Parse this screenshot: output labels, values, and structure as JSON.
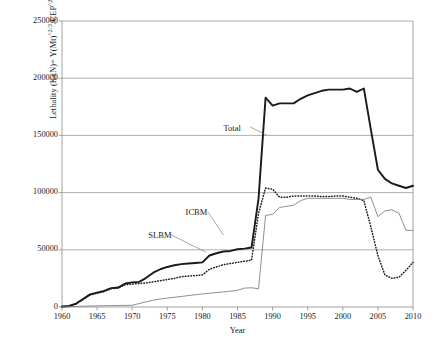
{
  "chart_data": {
    "type": "line",
    "title": "",
    "xlabel": "Year",
    "ylabel": "Lethality (KxN)= Y(Mt)^2/3/CEP^2 x N",
    "xlim": [
      1960,
      2010
    ],
    "ylim": [
      0,
      250000
    ],
    "grid": true,
    "legend_position": "inline-annotations",
    "xticks": [
      "1960",
      "1965",
      "1970",
      "1975",
      "1980",
      "1985",
      "1990",
      "1995",
      "2000",
      "2005",
      "2010"
    ],
    "xtick_values": [
      1960,
      1965,
      1970,
      1975,
      1980,
      1985,
      1990,
      1995,
      2000,
      2005,
      2010
    ],
    "yticks": [
      "0",
      "50000",
      "100000",
      "150000",
      "200000",
      "250000"
    ],
    "ytick_values": [
      0,
      50000,
      100000,
      150000,
      200000,
      250000
    ],
    "series": [
      {
        "name": "Total",
        "style": "solid-thick-black",
        "color": "#1a1a1a",
        "x": [
          1960,
          1961,
          1962,
          1963,
          1964,
          1965,
          1966,
          1967,
          1968,
          1969,
          1970,
          1971,
          1972,
          1973,
          1974,
          1975,
          1976,
          1977,
          1978,
          1979,
          1980,
          1981,
          1982,
          1983,
          1984,
          1985,
          1986,
          1987,
          1988,
          1989,
          1990,
          1991,
          1992,
          1993,
          1994,
          1995,
          1996,
          1997,
          1998,
          1999,
          2000,
          2001,
          2002,
          2003,
          2004,
          2005,
          2006,
          2007,
          2008,
          2009,
          2010
        ],
        "values": [
          500,
          900,
          3000,
          7000,
          11000,
          12500,
          14000,
          16500,
          17000,
          20500,
          21500,
          22000,
          25500,
          30000,
          33000,
          35000,
          36500,
          37500,
          38000,
          38500,
          39000,
          45000,
          47000,
          48500,
          49000,
          50500,
          51000,
          52000,
          95000,
          183000,
          176000,
          178000,
          178000,
          178000,
          182000,
          185000,
          187000,
          189000,
          190000,
          190000,
          190000,
          191000,
          188000,
          191000,
          155000,
          120000,
          112000,
          108000,
          106000,
          104000,
          106000
        ]
      },
      {
        "name": "ICBM",
        "style": "dotted-black",
        "color": "#1a1a1a",
        "x": [
          1960,
          1961,
          1962,
          1963,
          1964,
          1965,
          1966,
          1967,
          1968,
          1969,
          1970,
          1971,
          1972,
          1973,
          1974,
          1975,
          1976,
          1977,
          1978,
          1979,
          1980,
          1981,
          1982,
          1983,
          1984,
          1985,
          1986,
          1987,
          1988,
          1989,
          1990,
          1991,
          1992,
          1993,
          1994,
          1995,
          1996,
          1997,
          1998,
          1999,
          2000,
          2001,
          2002,
          2003,
          2004,
          2005,
          2006,
          2007,
          2008,
          2009,
          2010
        ],
        "values": [
          300,
          600,
          2500,
          6500,
          10500,
          12000,
          13500,
          16000,
          16500,
          19500,
          20000,
          20500,
          21000,
          22000,
          23000,
          24000,
          25000,
          26500,
          27000,
          27500,
          28000,
          33000,
          35000,
          37000,
          38000,
          39000,
          40000,
          41000,
          82000,
          104000,
          103000,
          96000,
          96000,
          97000,
          97000,
          97000,
          97000,
          96500,
          96500,
          97000,
          97000,
          96000,
          95000,
          93000,
          70000,
          45000,
          28000,
          25000,
          26000,
          32000,
          39000
        ]
      },
      {
        "name": "SLBM",
        "style": "solid-thin-gray",
        "color": "#7a7a7a",
        "x": [
          1960,
          1961,
          1962,
          1963,
          1964,
          1965,
          1966,
          1967,
          1968,
          1969,
          1970,
          1971,
          1972,
          1973,
          1974,
          1975,
          1976,
          1977,
          1978,
          1979,
          1980,
          1981,
          1982,
          1983,
          1984,
          1985,
          1986,
          1987,
          1988,
          1989,
          1990,
          1991,
          1992,
          1993,
          1994,
          1995,
          1996,
          1997,
          1998,
          1999,
          2000,
          2001,
          2002,
          2003,
          2004,
          2005,
          2006,
          2007,
          2008,
          2009,
          2010
        ],
        "values": [
          200,
          300,
          500,
          700,
          900,
          1000,
          1100,
          1200,
          1300,
          1400,
          1500,
          3000,
          4500,
          6000,
          7000,
          7800,
          8500,
          9200,
          10000,
          10700,
          11400,
          12000,
          12600,
          13200,
          13800,
          14600,
          16500,
          16800,
          16000,
          80000,
          81000,
          87000,
          88000,
          89000,
          93000,
          95000,
          95000,
          95000,
          95000,
          95000,
          95000,
          94000,
          94000,
          94000,
          96000,
          79000,
          84000,
          85000,
          82000,
          67000,
          67000
        ]
      }
    ],
    "annotations": [
      {
        "text": "Total",
        "x": 1983.0,
        "y": 156000
      },
      {
        "text": "ICBM",
        "x": 1977.6,
        "y": 82000
      },
      {
        "text": "SLBM",
        "x": 1972.3,
        "y": 62000
      }
    ]
  }
}
